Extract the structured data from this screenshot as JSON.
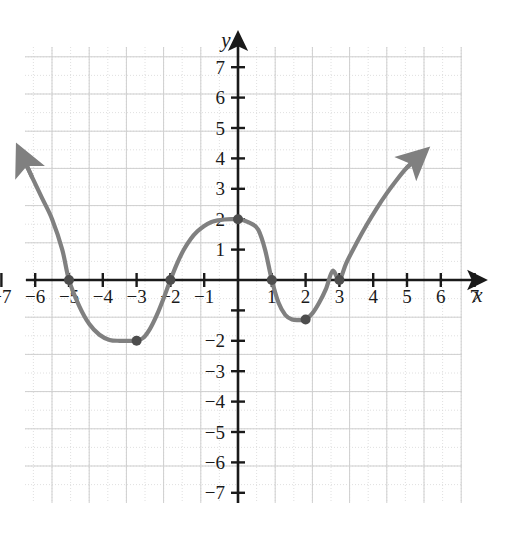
{
  "figure": {
    "kind": "cartesian-coordinate-plane",
    "background_color": "#ffffff",
    "grid_color": "#d8d8d8",
    "axis_color": "#1a1a1a",
    "curve_color": "#808080",
    "point_color": "#4d4d4d"
  },
  "axes": {
    "x_axis_label": "x",
    "y_axis_label": "y",
    "x_ticks": [
      -7,
      -6,
      -5,
      -4,
      -3,
      -2,
      -1,
      1,
      2,
      3,
      4,
      5,
      6,
      7
    ],
    "y_ticks": [
      -7,
      -6,
      -5,
      -4,
      -3,
      -2,
      -1,
      1,
      2,
      3,
      4,
      5,
      6,
      7
    ],
    "x_tick_labels": [
      "−7",
      "−6",
      "−5",
      "−4",
      "−3",
      "−2",
      "−1",
      "1",
      "2",
      "3",
      "4",
      "5",
      "6",
      "7"
    ],
    "y_tick_labels_shown": [
      "7",
      "6",
      "5",
      "4",
      "3",
      "2",
      "1",
      "−2",
      "−3",
      "−4",
      "−5",
      "−6",
      "−7"
    ],
    "y_tick_label_values": [
      7,
      6,
      5,
      4,
      3,
      2,
      1,
      -2,
      -3,
      -4,
      -5,
      -6,
      -7
    ],
    "origin_label": ""
  },
  "chart_data": {
    "type": "line",
    "title": "",
    "xlabel": "x",
    "ylabel": "y",
    "xlim": [
      -7.8,
      7.8
    ],
    "ylim": [
      -7.8,
      7.8
    ],
    "grid": true,
    "legend": "none",
    "series": [
      {
        "name": "polynomial-curve",
        "style": "smooth-curve-with-arrows-both-ends",
        "color": "#808080",
        "x": [
          -6.35,
          -6.1,
          -5.8,
          -5.5,
          -5.2,
          -5.0,
          -4.7,
          -4.4,
          -4.1,
          -3.8,
          -3.5,
          -3.2,
          -3.0,
          -2.8,
          -2.6,
          -2.4,
          -2.2,
          -2.0,
          -1.8,
          -1.6,
          -1.4,
          -1.2,
          -1.0,
          -0.8,
          -0.6,
          -0.4,
          -0.2,
          0.0,
          0.2,
          0.4,
          0.6,
          0.8,
          1.0,
          1.2,
          1.4,
          1.6,
          1.8,
          2.0,
          2.2,
          2.4,
          2.6,
          2.8,
          3.0,
          3.2,
          3.5,
          3.8,
          4.1,
          4.4,
          4.7,
          5.0,
          5.3
        ],
        "y": [
          4.0,
          3.4,
          2.7,
          2.0,
          1.0,
          0.0,
          -0.85,
          -1.45,
          -1.8,
          -1.97,
          -2.0,
          -2.0,
          -2.0,
          -1.9,
          -1.6,
          -1.15,
          -0.6,
          0.0,
          0.55,
          1.0,
          1.35,
          1.6,
          1.78,
          1.9,
          1.96,
          1.99,
          2.0,
          2.0,
          1.95,
          1.85,
          1.65,
          1.0,
          0.0,
          -0.75,
          -1.15,
          -1.3,
          -1.32,
          -1.3,
          -1.1,
          -0.75,
          -0.3,
          0.3,
          0.0,
          0.55,
          1.2,
          1.8,
          2.35,
          2.85,
          3.3,
          3.7,
          4.0
        ]
      }
    ],
    "marked_points": [
      {
        "label": "x-intercept",
        "x": -5,
        "y": 0
      },
      {
        "label": "x-intercept",
        "x": -2,
        "y": 0
      },
      {
        "label": "local-minimum",
        "x": -3,
        "y": -2
      },
      {
        "label": "local-maximum-and-y-intercept",
        "x": 0,
        "y": 2
      },
      {
        "label": "x-intercept",
        "x": 1,
        "y": 0
      },
      {
        "label": "local-minimum",
        "x": 2,
        "y": -1.3
      },
      {
        "label": "x-intercept",
        "x": 3,
        "y": 0
      }
    ],
    "arrows": [
      {
        "label": "left-end-arrow",
        "x": -6.35,
        "y": 4.0,
        "direction": "up-left"
      },
      {
        "label": "right-end-arrow",
        "x": 5.3,
        "y": 4.0,
        "direction": "up-right"
      }
    ]
  }
}
